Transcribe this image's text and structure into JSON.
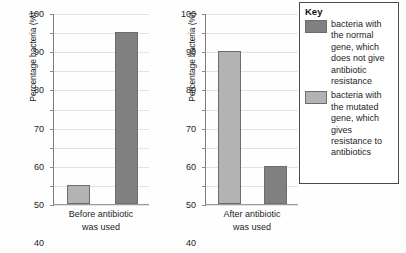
{
  "chart_data": {
    "type": "bar",
    "title": "",
    "xlabel": "",
    "ylabel": "Percentage bacteria (%)",
    "ylim": [
      0,
      100
    ],
    "ytick_step": 10,
    "yticks": [
      100,
      90,
      80,
      70,
      60,
      50,
      40,
      30,
      20,
      10,
      0
    ],
    "grid": true,
    "legend_position": "right",
    "panels": [
      {
        "id": "before",
        "category": "Before antibiotic was used",
        "category_line1": "Before antibiotic",
        "category_line2": "was used",
        "bars": [
          {
            "series": "mutated",
            "value": 10,
            "color": "#b3b3b3"
          },
          {
            "series": "normal",
            "value": 90,
            "color": "#808080"
          }
        ]
      },
      {
        "id": "after",
        "category": "After antibiotic was used",
        "category_line1": "After antibiotic",
        "category_line2": "was used",
        "bars": [
          {
            "series": "mutated",
            "value": 80,
            "color": "#b3b3b3"
          },
          {
            "series": "normal",
            "value": 20,
            "color": "#808080"
          }
        ]
      }
    ],
    "series": [
      {
        "name": "normal",
        "label": "bacteria with the normal gene, which does not give antibiotic resistance",
        "color": "#808080",
        "values": [
          90,
          20
        ]
      },
      {
        "name": "mutated",
        "label": "bacteria with the mutated gene, which gives resistance to antibiotics",
        "color": "#b3b3b3",
        "values": [
          10,
          80
        ]
      }
    ],
    "categories": [
      "Before antibiotic was used",
      "After antibiotic was used"
    ]
  },
  "key": {
    "title": "Key",
    "entries": [
      {
        "swatch_color": "#808080",
        "text": "bacteria with the normal gene, which does not give antibiotic resistance"
      },
      {
        "swatch_color": "#b3b3b3",
        "text": "bacteria with the mutated gene, which gives resistance to antibiotics"
      }
    ]
  }
}
